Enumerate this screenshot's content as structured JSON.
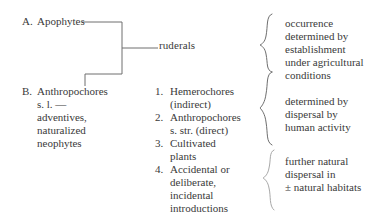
{
  "diagram": {
    "left_entries": [
      {
        "marker": "A.",
        "label": "Apophytes"
      },
      {
        "marker": "B.",
        "label": "Anthropochores\ns. l. —\nadventives,\nnaturalized\nneophytes"
      }
    ],
    "junction_label": "ruderals",
    "numbered_items": [
      {
        "num": "1.",
        "label": "Hemerochores\n(indirect)"
      },
      {
        "num": "2.",
        "label": "Anthropochores\ns. str. (direct)"
      },
      {
        "num": "3.",
        "label": "Cultivated\nplants"
      },
      {
        "num": "4.",
        "label": "Accidental or\ndeliberate,\nincidental\nintroductions"
      }
    ],
    "right_blocks": [
      "occurrence\ndetermined by\nestablishment\nunder agricultural\nconditions",
      "determined by\ndispersal by\nhuman activity",
      "further natural\ndispersal in\n± natural habitats"
    ],
    "colors": {
      "background": "#ffffff",
      "text": "#3a3a3a",
      "rule": "#6e6e6e",
      "brace": "#8a8a8a"
    }
  }
}
